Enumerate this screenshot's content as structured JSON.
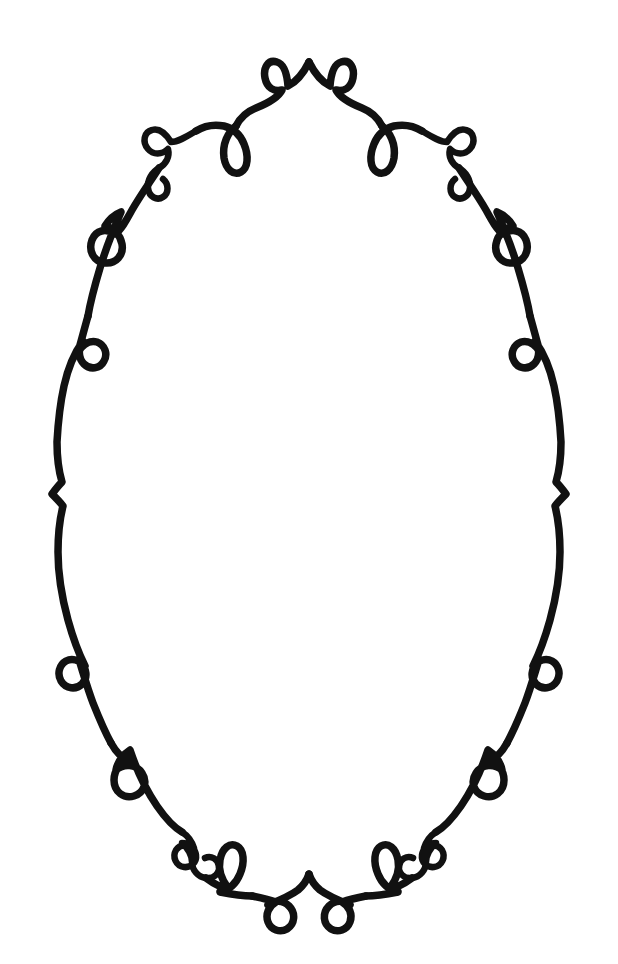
{
  "artwork": {
    "title": "Decorative Oval Scroll Frame",
    "kind": "line-drawing",
    "orientation": "portrait",
    "symmetry": "bilateral-vertical",
    "background_color": "#ffffff",
    "ink_color": "#111111",
    "canvas": {
      "width": 618,
      "height": 964
    },
    "stroke": {
      "main_width": 7.5,
      "curl_width": 6.5,
      "linecap": "round",
      "linejoin": "round"
    },
    "interior_region": {
      "label": "blank-writing-area",
      "center_x": 309,
      "center_y": 487,
      "approx_width": 470,
      "approx_height": 760
    }
  },
  "frame": {
    "outline": {
      "name": "oval-outline",
      "top_apex_y": 58,
      "bottom_apex_y": 908,
      "left_extent_x": 22,
      "right_extent_x": 562,
      "widest_y": 487
    },
    "ornaments": [
      {
        "id": "top-peak",
        "type": "peak-cusp",
        "x": 309,
        "y": 58,
        "side": "center"
      },
      {
        "id": "top-loop-left",
        "type": "teardrop-loop",
        "x": 262,
        "y": 72,
        "side": "left"
      },
      {
        "id": "top-loop-right",
        "type": "teardrop-loop",
        "x": 337,
        "y": 72,
        "side": "right"
      },
      {
        "id": "upper-teardrop-left",
        "type": "teardrop-loop",
        "x": 208,
        "y": 128,
        "side": "left"
      },
      {
        "id": "upper-teardrop-right",
        "type": "teardrop-loop",
        "x": 383,
        "y": 128,
        "side": "right"
      },
      {
        "id": "upper-scroll-left",
        "type": "double-curl-scroll",
        "x": 130,
        "y": 140,
        "side": "left"
      },
      {
        "id": "upper-scroll-right",
        "type": "double-curl-scroll",
        "x": 455,
        "y": 140,
        "side": "right"
      },
      {
        "id": "mid-upper-oval-left",
        "type": "oval-loop",
        "x": 97,
        "y": 227,
        "side": "left"
      },
      {
        "id": "mid-upper-oval-right",
        "type": "oval-loop",
        "x": 493,
        "y": 227,
        "side": "right"
      },
      {
        "id": "mid-upper-circle-left",
        "type": "small-circle-loop",
        "x": 50,
        "y": 305,
        "side": "left"
      },
      {
        "id": "mid-upper-circle-right",
        "type": "small-circle-loop",
        "x": 537,
        "y": 305,
        "side": "right"
      },
      {
        "id": "waist-cusp-left",
        "type": "inward-cusp",
        "x": 24,
        "y": 487,
        "side": "left"
      },
      {
        "id": "waist-cusp-right",
        "type": "inward-cusp",
        "x": 562,
        "y": 487,
        "side": "right"
      },
      {
        "id": "mid-lower-circle-left",
        "type": "small-circle-loop",
        "x": 50,
        "y": 660,
        "side": "left"
      },
      {
        "id": "mid-lower-circle-right",
        "type": "small-circle-loop",
        "x": 537,
        "y": 660,
        "side": "right"
      },
      {
        "id": "mid-lower-oval-left",
        "type": "oval-loop",
        "x": 97,
        "y": 742,
        "side": "left"
      },
      {
        "id": "mid-lower-oval-right",
        "type": "oval-loop",
        "x": 493,
        "y": 742,
        "side": "right"
      },
      {
        "id": "lower-scroll-left",
        "type": "double-curl-scroll",
        "x": 128,
        "y": 832,
        "side": "left"
      },
      {
        "id": "lower-scroll-right",
        "type": "double-curl-scroll",
        "x": 456,
        "y": 832,
        "side": "right"
      },
      {
        "id": "lower-teardrop-left",
        "type": "teardrop-loop",
        "x": 208,
        "y": 842,
        "side": "left"
      },
      {
        "id": "lower-teardrop-right",
        "type": "teardrop-loop",
        "x": 383,
        "y": 842,
        "side": "right"
      },
      {
        "id": "bottom-loop-left",
        "type": "teardrop-loop",
        "x": 262,
        "y": 896,
        "side": "left"
      },
      {
        "id": "bottom-loop-right",
        "type": "teardrop-loop",
        "x": 337,
        "y": 896,
        "side": "right"
      },
      {
        "id": "bottom-cusp",
        "type": "valley-cusp",
        "x": 309,
        "y": 908,
        "side": "center"
      }
    ],
    "ornament_counts": {
      "teardrop_loops": 8,
      "oval_loops": 4,
      "small_circle_loops": 4,
      "double_curl_scrolls": 4,
      "cusps": 4
    }
  },
  "paths": {
    "top_right_arc": "M 309 62 C 315 74 322 82 330 86 C 331 74 334 64 341 62 C 350 59 355 68 353 78 C 351 88 344 92 336 90 C 340 98 352 104 362 108 C 372 112 378 118 382 126",
    "top_left_arc": "M 309 62 C 303 74 296 82 288 86 C 287 74 284 64 277 62 C 268 59 263 68 265 78 C 267 88 274 92 282 90 C 278 98 266 104 256 108 C 246 112 240 118 236 126",
    "teardrop_right": "M 382 126 C 390 132 396 144 394 158 C 392 170 384 176 377 172 C 370 168 369 156 374 144 C 378 134 386 128 394 126 C 404 124 414 126 422 131",
    "teardrop_left": "M 236 126 C 228 132 222 144 224 158 C 226 170 234 176 241 172 C 248 168 249 156 244 144 C 240 134 232 128 224 126 C 214 124 204 126 196 131",
    "scroll_right": "M 422 131 C 432 137 440 142 447 142 C 452 134 459 128 466 130 C 474 132 476 142 470 149 C 465 155 456 155 450 149 C 448 157 452 164 459 168 C 466 172 471 180 470 188 C 469 197 461 201 455 197 C 449 193 449 184 455 179",
    "scroll_left": "M 196 131 C 186 137 178 142 171 142 C 166 134 159 128 152 130 C 144 132 142 142 148 149 C 153 155 162 155 168 149 C 170 157 166 164 159 168 C 152 172 147 180 148 188 C 149 197 157 201 163 197 C 169 193 169 184 163 179",
    "upper_right_side": "M 459 168 C 468 182 478 196 486 210 C 492 221 497 230 503 234 C 512 228 522 230 526 240 C 530 251 524 262 513 263 C 502 264 494 255 496 244 C 498 234 505 228 513 226 C 508 218 502 214 497 212 C 504 228 512 248 518 268 C 524 288 528 304 530 316",
    "upper_left_side": "M 159 168 C 150 182 140 196 132 210 C 126 221 121 230 115 234 C 106 228 96 230 92 240 C 88 251 94 262 105 263 C 116 264 124 255 122 244 C 120 234 113 228 105 226 C 110 218 116 214 121 212 C 114 228 106 248 100 268 C 94 288 90 304 88 316",
    "mid_right": "M 530 316 C 534 330 537 342 540 352 C 535 344 528 340 521 342 C 513 345 510 354 514 361 C 518 369 528 370 534 364 C 540 358 540 348 535 341 C 543 352 550 368 554 386 C 558 404 560 424 561 442 C 561 458 559 472 556 482 C 560 486 563 490 566 494 C 562 498 558 502 555 506 C 558 518 560 534 560 552 C 560 574 556 598 550 620 C 545 638 539 654 533 666 C 539 660 546 658 552 661 C 559 665 561 674 557 681 C 552 689 542 690 536 684 C 530 678 531 668 538 663 C 534 676 530 690 525 703 C 519 718 513 732 507 743",
    "mid_left": "M 88 316 C 84 330 81 342 78 352 C 83 344 90 340 97 342 C 105 345 108 354 104 361 C 100 369 90 370 84 364 C 78 358 78 348 83 341 C 75 352 68 368 64 386 C 60 404 58 424 57 442 C 57 458 59 472 62 482 C 58 486 55 490 52 494 C 56 498 60 502 63 506 C 60 518 58 534 58 552 C 58 574 62 598 68 620 C 73 638 79 654 85 666 C 79 660 72 658 66 661 C 59 665 57 674 61 681 C 66 689 76 690 82 684 C 88 678 87 668 80 663 C 84 676 88 690 93 703 C 99 718 105 732 111 743",
    "lower_right_side": "M 507 743 C 502 752 496 758 490 760 C 497 762 504 770 504 780 C 504 792 494 799 484 796 C 474 793 470 782 476 773 C 482 764 494 763 502 770 C 500 760 494 754 488 750 C 482 768 472 790 461 806 C 452 819 443 828 436 832",
    "lower_left_side": "M 111 743 C 116 752 122 758 128 760 C 121 762 114 770 114 780 C 114 792 124 799 134 796 C 144 793 148 782 142 773 C 136 764 124 763 116 770 C 118 760 124 754 130 750 C 136 768 146 790 157 806 C 166 819 175 828 182 832",
    "scroll_low_right": "M 436 832 C 430 836 426 842 424 848 C 430 844 438 844 442 850 C 446 857 442 866 434 867 C 427 868 421 862 422 855 C 423 848 429 843 436 843 C 430 848 426 856 426 862 C 426 870 420 877 412 878 C 404 879 398 873 399 866 C 400 859 407 855 413 858",
    "scroll_low_left": "M 182 832 C 188 836 192 842 194 848 C 188 844 180 844 176 850 C 172 857 176 866 184 867 C 191 868 197 862 196 855 C 195 848 189 843 182 843 C 188 848 192 856 192 862 C 192 870 198 877 206 878 C 214 879 220 873 219 866 C 218 859 211 855 205 858",
    "teardrop_low_right": "M 412 878 C 404 884 396 888 390 888 C 396 880 400 870 398 860 C 396 848 388 842 381 846 C 374 850 373 862 378 874 C 382 884 390 890 398 892 C 388 894 376 896 366 896",
    "teardrop_low_left": "M 206 878 C 214 884 222 888 228 888 C 222 880 218 870 220 860 C 222 848 230 842 237 846 C 244 850 245 862 240 874 C 236 884 228 890 220 892 C 230 894 242 896 252 896",
    "bottom_right_arc": "M 366 896 C 356 898 348 900 342 902 C 349 906 353 914 350 922 C 347 930 338 933 331 929 C 323 924 322 913 329 906 C 335 900 344 900 350 905 C 340 901 328 896 320 890 C 314 885 311 880 309 874",
    "bottom_left_arc": "M 252 896 C 262 898 270 900 276 902 C 269 906 265 914 268 922 C 271 930 280 933 287 929 C 295 924 296 913 289 906 C 283 900 274 900 268 905 C 278 901 290 896 298 890 C 304 885 307 880 309 874"
  }
}
